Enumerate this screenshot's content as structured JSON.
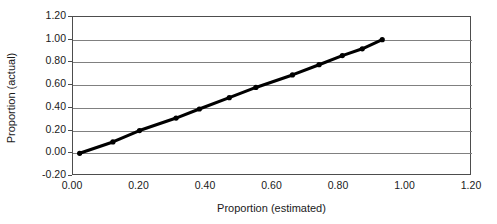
{
  "chart_data": {
    "type": "scatter",
    "title": "",
    "xlabel": "Proportion (estimated)",
    "ylabel": "Proportion (actual)",
    "xlim": [
      0.0,
      1.2
    ],
    "ylim": [
      -0.2,
      1.2
    ],
    "xticks": [
      "0.00",
      "0.20",
      "0.40",
      "0.60",
      "0.80",
      "1.00",
      "1.20"
    ],
    "xtick_values": [
      0.0,
      0.2,
      0.4,
      0.6,
      0.8,
      1.0,
      1.2
    ],
    "yticks": [
      "-0.20",
      "0.00",
      "0.20",
      "0.40",
      "0.60",
      "0.80",
      "1.00",
      "1.20"
    ],
    "ytick_values": [
      -0.2,
      0.0,
      0.2,
      0.4,
      0.6,
      0.8,
      1.0,
      1.2
    ],
    "grid": "horizontal",
    "grid_color": "#808080",
    "legend": "none",
    "marker_color": "#000000",
    "line_color": "#000000",
    "series": [
      {
        "name": "Proportion actual vs estimated",
        "x": [
          0.02,
          0.12,
          0.2,
          0.31,
          0.38,
          0.47,
          0.55,
          0.66,
          0.74,
          0.81,
          0.87,
          0.93
        ],
        "y": [
          0.0,
          0.1,
          0.2,
          0.31,
          0.39,
          0.49,
          0.58,
          0.69,
          0.78,
          0.86,
          0.92,
          1.0
        ]
      }
    ]
  }
}
